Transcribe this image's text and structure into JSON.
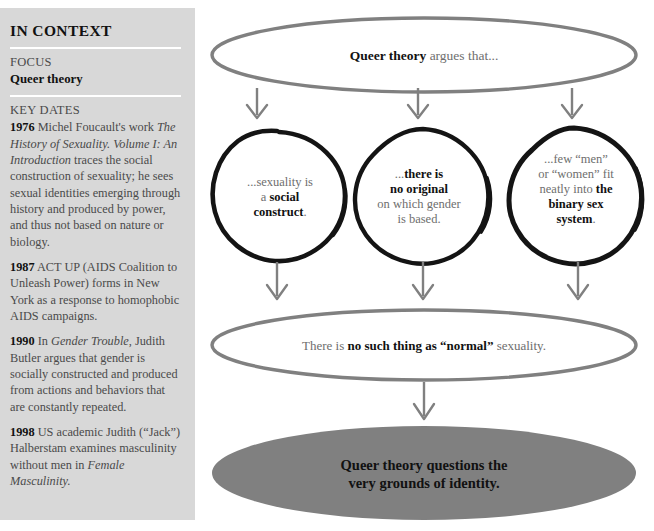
{
  "sidebar": {
    "title": "IN CONTEXT",
    "focus_label": "FOCUS",
    "focus_value": "Queer theory",
    "key_dates_label": "KEY DATES",
    "entries": [
      {
        "year": "1976",
        "text_parts": [
          {
            "style": "normal",
            "text": " Michel Foucault's work "
          },
          {
            "style": "italic",
            "text": "The History of Sexuality. Volume I: An Introduction"
          },
          {
            "style": "normal",
            "text": " traces the social construction of sexuality; he sees sexual identities emerging through history and produced by power, and thus not based on nature or biology."
          }
        ],
        "plain": "1976 Michel Foucault's work The History of Sexuality. Volume I: An Introduction traces the social construction of sexuality; he sees sexual identities emerging through history and produced by power, and thus not based on nature or biology."
      },
      {
        "year": "1987",
        "text_parts": [
          {
            "style": "normal",
            "text": " ACT UP (AIDS Coalition to Unleash Power) forms in New York as a response to homophobic AIDS campaigns."
          }
        ],
        "plain": "1987 ACT UP (AIDS Coalition to Unleash Power) forms in New York as a response to homophobic AIDS campaigns."
      },
      {
        "year": "1990",
        "text_parts": [
          {
            "style": "normal",
            "text": " In "
          },
          {
            "style": "italic",
            "text": "Gender Trouble"
          },
          {
            "style": "normal",
            "text": ", Judith Butler argues that gender is socially constructed and produced from actions and behaviors that are constantly repeated."
          }
        ],
        "plain": "1990 In Gender Trouble, Judith Butler argues that gender is socially constructed and produced from actions and behaviors that are constantly repeated."
      },
      {
        "year": "1998",
        "text_parts": [
          {
            "style": "normal",
            "text": " US academic Judith (“Jack”) Halberstam examines masculinity without men in "
          },
          {
            "style": "italic",
            "text": "Female Masculinity."
          }
        ],
        "plain": "1998 US academic Judith (“Jack”) Halberstam examines masculinity without men in Female Masculinity."
      }
    ]
  },
  "diagram": {
    "top_ellipse": {
      "lines": [
        [
          {
            "bold": true,
            "text": "Queer theory"
          },
          {
            "bold": false,
            "text": " argues that..."
          }
        ]
      ],
      "plain": "Queer theory argues that..."
    },
    "circles": [
      {
        "name": "social-construct",
        "lines": [
          [
            {
              "bold": false,
              "text": "...sexuality is"
            }
          ],
          [
            {
              "bold": false,
              "text": "a "
            },
            {
              "bold": true,
              "text": "social"
            }
          ],
          [
            {
              "bold": true,
              "text": "construct"
            },
            {
              "bold": false,
              "text": "."
            }
          ]
        ],
        "plain": "...sexuality is a social construct."
      },
      {
        "name": "no-original",
        "lines": [
          [
            {
              "bold": false,
              "text": "..."
            },
            {
              "bold": true,
              "text": "there is"
            }
          ],
          [
            {
              "bold": true,
              "text": "no original"
            }
          ],
          [
            {
              "bold": false,
              "text": "on which gender"
            }
          ],
          [
            {
              "bold": false,
              "text": "is based."
            }
          ]
        ],
        "plain": "...there is no original on which gender is based."
      },
      {
        "name": "binary-sex-system",
        "lines": [
          [
            {
              "bold": false,
              "text": "...few “men”"
            }
          ],
          [
            {
              "bold": false,
              "text": "or “women” fit"
            }
          ],
          [
            {
              "bold": false,
              "text": "neatly into "
            },
            {
              "bold": true,
              "text": "the"
            }
          ],
          [
            {
              "bold": true,
              "text": "binary sex"
            }
          ],
          [
            {
              "bold": true,
              "text": "system"
            },
            {
              "bold": false,
              "text": "."
            }
          ]
        ],
        "plain": "...few “men” or “women” fit neatly into the binary sex system."
      }
    ],
    "bottom_ellipse": {
      "lines": [
        [
          {
            "bold": false,
            "text": "There is "
          },
          {
            "bold": true,
            "text": "no such thing as “normal”"
          },
          {
            "bold": false,
            "text": " sexuality."
          }
        ]
      ],
      "plain": "There is no such thing as “normal” sexuality."
    },
    "conclusion_ellipse": {
      "lines": [
        [
          {
            "bold": true,
            "text": "Queer theory questions the"
          }
        ],
        [
          {
            "bold": true,
            "text": "very grounds of identity."
          }
        ]
      ],
      "plain": "Queer theory questions the very grounds of identity."
    }
  },
  "colors": {
    "sidebar_bg": "#d8d8d8",
    "page_bg": "#ffffff",
    "rule": "#ffffff",
    "body_text": "#4a4a4a",
    "heading_text": "#111111",
    "ellipse_stroke": "#808080",
    "circle_stroke": "#111111",
    "arrow": "#808080",
    "conclusion_fill": "#808080"
  }
}
